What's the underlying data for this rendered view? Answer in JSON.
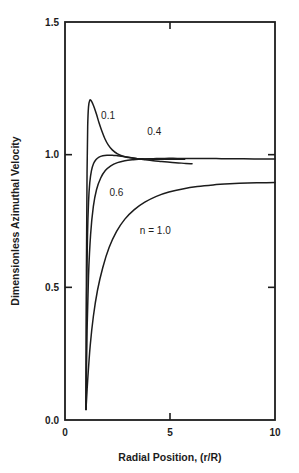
{
  "chart_data": {
    "type": "line",
    "title": "",
    "subtitle": "",
    "xlabel": "Radial Position, (r/R)",
    "ylabel": "Dimensionless Azimuthal Velocity",
    "xlim": [
      0,
      10
    ],
    "ylim": [
      0.0,
      1.5
    ],
    "xticks": [
      0,
      5,
      10
    ],
    "xticklabels": [
      "0",
      "5",
      "10"
    ],
    "yticks": [
      0.0,
      0.5,
      1.0,
      1.5
    ],
    "yticklabels": [
      "0.0",
      "0.5",
      "1.0",
      "1.5"
    ],
    "grid": false,
    "legend": "inline-annotations",
    "line_color": "#1c1c1c",
    "background": "#ffffff",
    "annotations": [
      {
        "text": "0.1",
        "x": 2.05,
        "y": 1.135
      },
      {
        "text": "0.4",
        "x": 4.25,
        "y": 1.075
      },
      {
        "text": "0.6",
        "x": 2.45,
        "y": 0.845
      },
      {
        "text": "n = 1.0",
        "x": 4.3,
        "y": 0.7
      }
    ],
    "series": [
      {
        "name": "0.1",
        "label": "n = 0.1",
        "x": [
          1.0,
          1.02,
          1.05,
          1.08,
          1.12,
          1.18,
          1.25,
          1.32,
          1.4,
          1.5,
          1.62,
          1.75,
          1.9,
          2.05,
          2.25,
          2.5,
          2.8,
          3.1,
          3.45,
          3.8,
          4.2,
          4.6,
          5.0,
          5.35,
          5.7
        ],
        "y": [
          0.04,
          0.56,
          0.93,
          1.105,
          1.18,
          1.205,
          1.203,
          1.192,
          1.176,
          1.152,
          1.12,
          1.09,
          1.06,
          1.038,
          1.018,
          1.003,
          0.993,
          0.988,
          0.985,
          0.984,
          0.983,
          0.983,
          0.983,
          0.983,
          0.983
        ]
      },
      {
        "name": "0.4",
        "label": "n = 0.4",
        "x": [
          1.0,
          1.03,
          1.07,
          1.12,
          1.18,
          1.26,
          1.36,
          1.48,
          1.62,
          1.8,
          2.0,
          2.25,
          2.5,
          2.8,
          3.1,
          3.45,
          3.8,
          4.2,
          4.6,
          5.0,
          5.4,
          5.75,
          6.05
        ],
        "y": [
          0.04,
          0.47,
          0.69,
          0.82,
          0.895,
          0.94,
          0.967,
          0.982,
          0.991,
          0.996,
          0.998,
          0.998,
          0.996,
          0.993,
          0.989,
          0.985,
          0.981,
          0.977,
          0.974,
          0.971,
          0.969,
          0.967,
          0.966
        ]
      },
      {
        "name": "0.6",
        "label": "n = 0.6",
        "x": [
          1.0,
          1.05,
          1.12,
          1.22,
          1.35,
          1.5,
          1.7,
          1.92,
          2.18,
          2.5,
          2.85,
          3.25,
          3.7,
          4.2,
          4.75,
          5.35,
          6.0,
          6.7,
          7.45,
          8.2,
          9.0,
          9.5,
          10.0
        ],
        "y": [
          0.04,
          0.335,
          0.545,
          0.7,
          0.805,
          0.868,
          0.912,
          0.94,
          0.958,
          0.97,
          0.977,
          0.981,
          0.984,
          0.985,
          0.986,
          0.986,
          0.986,
          0.986,
          0.985,
          0.985,
          0.984,
          0.984,
          0.984
        ]
      },
      {
        "name": "1.0",
        "label": "n = 1.0",
        "x": [
          1.0,
          1.08,
          1.2,
          1.35,
          1.55,
          1.8,
          2.1,
          2.45,
          2.85,
          3.3,
          3.8,
          4.35,
          4.95,
          5.6,
          6.3,
          7.05,
          7.85,
          8.7,
          9.35,
          10.0
        ],
        "y": [
          0.04,
          0.15,
          0.28,
          0.39,
          0.49,
          0.575,
          0.65,
          0.71,
          0.757,
          0.793,
          0.821,
          0.843,
          0.859,
          0.871,
          0.88,
          0.886,
          0.89,
          0.893,
          0.894,
          0.895
        ]
      }
    ]
  }
}
